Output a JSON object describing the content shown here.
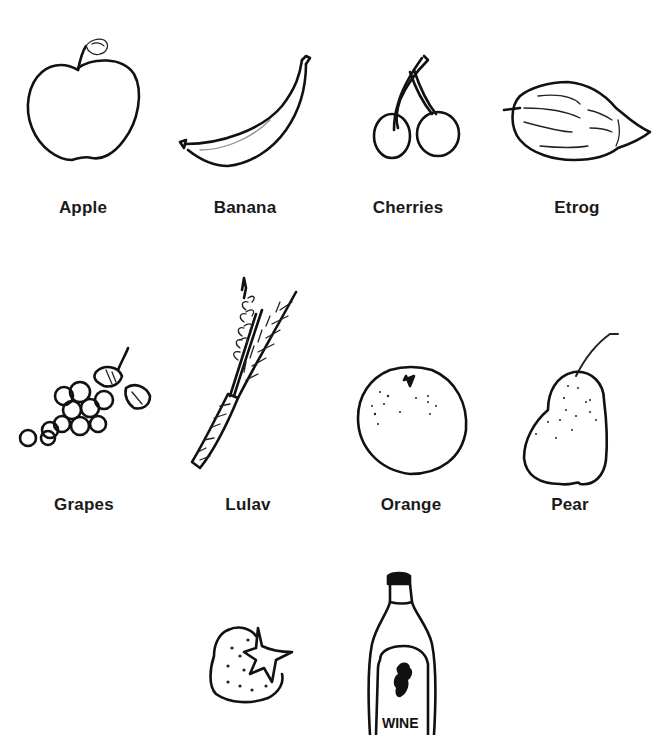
{
  "document": {
    "type": "fruit picture worksheet",
    "rows": [
      {
        "items": [
          {
            "id": "apple",
            "label": "Apple",
            "icon": "apple-drawing"
          },
          {
            "id": "banana",
            "label": "Banana",
            "icon": "banana-drawing"
          },
          {
            "id": "cherries",
            "label": "Cherries",
            "icon": "cherries-drawing"
          },
          {
            "id": "etrog",
            "label": "Etrog",
            "icon": "etrog-drawing"
          }
        ]
      },
      {
        "items": [
          {
            "id": "grapes",
            "label": "Grapes",
            "icon": "grapes-drawing"
          },
          {
            "id": "lulav",
            "label": "Lulav",
            "icon": "lulav-drawing"
          },
          {
            "id": "orange",
            "label": "Orange",
            "icon": "orange-drawing"
          },
          {
            "id": "pear",
            "label": "Pear",
            "icon": "pear-drawing"
          }
        ]
      },
      {
        "items": [
          {
            "id": "strawberry",
            "label": "",
            "icon": "strawberry-drawing"
          },
          {
            "id": "wine",
            "label": "",
            "icon": "wine-bottle-drawing",
            "bottle_text": "WINE"
          }
        ]
      }
    ]
  },
  "colors": {
    "ink": "#111111",
    "background": "#ffffff"
  }
}
